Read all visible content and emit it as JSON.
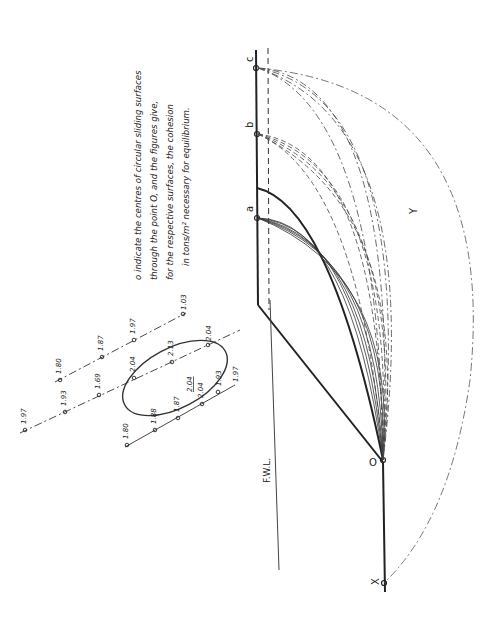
{
  "figure": {
    "orientation": "rotated 90 degrees clockwise",
    "legend_lines": [
      "o indicate the centres of circular sliding surfaces",
      "through the point O, and the figures give,",
      "for the respective surfaces, the cohesion",
      "in tons/m² necessary for equilibrium."
    ],
    "points": {
      "a": "a",
      "b": "b",
      "c": "c",
      "O": "O",
      "X": "X",
      "Y": "Y"
    },
    "water_level_label": "F.W.L.",
    "centre_lines": [
      {
        "name": "line-1",
        "values": [
          "1.97",
          "1.93",
          "1.69",
          "2.04",
          "2.13",
          "2.04"
        ]
      },
      {
        "name": "line-2",
        "values": [
          "1.80",
          "1.87",
          "1.97",
          "1.03"
        ]
      },
      {
        "name": "line-3",
        "values": [
          "1.80",
          "1.88",
          "1.87",
          "2.04",
          "1.93",
          "1.97"
        ]
      }
    ],
    "min_value_label": "2.04",
    "colors": {
      "ink": "#222222",
      "paper": "#ffffff"
    }
  }
}
